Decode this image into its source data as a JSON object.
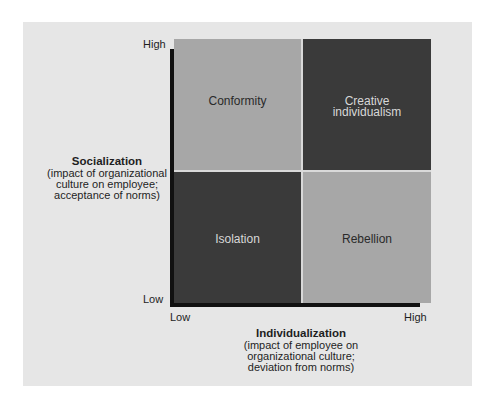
{
  "diagram": {
    "quadrants": {
      "top_left": "Conformity",
      "top_right_line1": "Creative",
      "top_right_line2": "individualism",
      "bottom_left": "Isolation",
      "bottom_right": "Rebellion"
    },
    "y_axis": {
      "high_label": "High",
      "low_label": "Low",
      "title": "Socialization",
      "subtitle_line1": "(impact of organizational",
      "subtitle_line2": "culture on employee;",
      "subtitle_line3": "acceptance of norms)"
    },
    "x_axis": {
      "low_label": "Low",
      "high_label": "High",
      "title": "Individualization",
      "subtitle_line1": "(impact of employee on",
      "subtitle_line2": "organizational culture;",
      "subtitle_line3": "deviation from norms)"
    },
    "colors": {
      "panel_background": "#e6e6e6",
      "light_quadrant": "#a7a7a7",
      "dark_quadrant": "#3a3a3a",
      "axis": "#111111"
    }
  }
}
